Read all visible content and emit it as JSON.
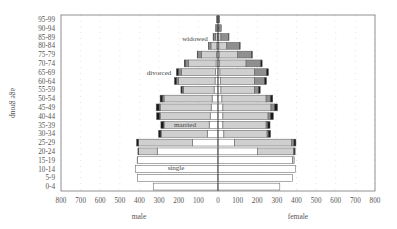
{
  "chart_data": {
    "type": "bar",
    "subtype": "population-pyramid-stacked",
    "title": "",
    "xlabel_left": "male",
    "xlabel_right": "female",
    "ylabel": "age group",
    "xlim": [
      -800,
      800
    ],
    "x_ticks": [
      "800",
      "700",
      "600",
      "500",
      "400",
      "300",
      "200",
      "100",
      "0",
      "100",
      "200",
      "300",
      "400",
      "500",
      "600",
      "700",
      "800"
    ],
    "grid": "dotted vertical",
    "categories": [
      "0-4",
      "5-9",
      "10-14",
      "15-19",
      "20-24",
      "25-29",
      "30-34",
      "35-39",
      "40-44",
      "45-49",
      "50-54",
      "55-59",
      "60-64",
      "65-69",
      "70-74",
      "75-79",
      "80-84",
      "85-89",
      "90-94",
      "95-99"
    ],
    "legend_annotations": [
      {
        "text": "single",
        "status": "single"
      },
      {
        "text": "married",
        "status": "married"
      },
      {
        "text": "divorced",
        "status": "divorced"
      },
      {
        "text": "widowed",
        "status": "widowed"
      }
    ],
    "series_order": [
      "single",
      "married",
      "widowed",
      "divorced"
    ],
    "colors": {
      "single": "#ffffff",
      "married": "#cfcfcf",
      "widowed": "#8f8f8f",
      "divorced": "#1a1a1a",
      "border": "#555555"
    },
    "male": {
      "single": [
        330,
        410,
        420,
        410,
        310,
        130,
        55,
        45,
        40,
        35,
        30,
        20,
        15,
        12,
        10,
        8,
        6,
        4,
        2,
        1
      ],
      "married": [
        0,
        0,
        0,
        2,
        95,
        275,
        235,
        230,
        255,
        260,
        245,
        155,
        185,
        175,
        140,
        75,
        30,
        10,
        3,
        1
      ],
      "widowed": [
        0,
        0,
        0,
        0,
        0,
        0,
        1,
        2,
        3,
        5,
        8,
        8,
        12,
        15,
        17,
        20,
        12,
        10,
        8,
        6
      ],
      "divorced": [
        0,
        0,
        0,
        0,
        3,
        10,
        12,
        14,
        15,
        15,
        12,
        6,
        10,
        10,
        5,
        3,
        1,
        1,
        0,
        0
      ]
    },
    "female": {
      "single": [
        315,
        380,
        395,
        380,
        200,
        85,
        30,
        25,
        25,
        25,
        20,
        15,
        12,
        10,
        8,
        6,
        5,
        3,
        2,
        1
      ],
      "married": [
        0,
        0,
        0,
        8,
        185,
        290,
        220,
        220,
        230,
        245,
        225,
        170,
        175,
        175,
        135,
        95,
        40,
        12,
        3,
        1
      ],
      "widowed": [
        0,
        0,
        0,
        0,
        3,
        12,
        6,
        8,
        12,
        18,
        22,
        22,
        50,
        62,
        75,
        70,
        65,
        40,
        12,
        7
      ],
      "divorced": [
        0,
        0,
        0,
        0,
        5,
        10,
        12,
        12,
        15,
        15,
        12,
        8,
        10,
        10,
        7,
        4,
        3,
        1,
        0,
        0
      ]
    }
  },
  "labels": {
    "male": "male",
    "female": "female",
    "ylabel": "age group",
    "single": "single",
    "married": "married",
    "divorced": "divorced",
    "widowed": "widowed"
  }
}
